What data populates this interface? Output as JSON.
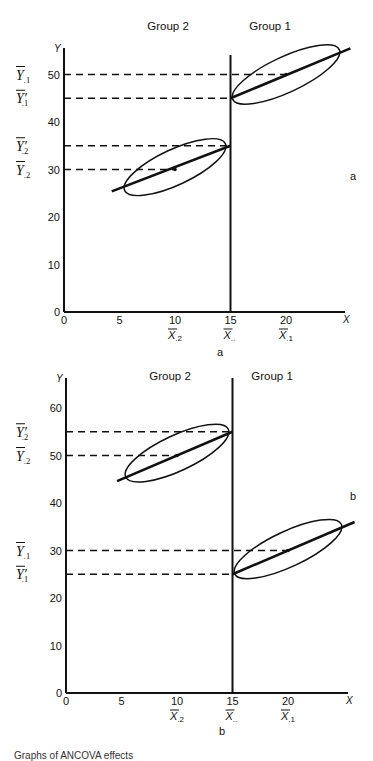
{
  "chart_data": [
    {
      "panel": "a",
      "type": "scatter",
      "title": "",
      "xlabel": "X",
      "ylabel": "Y",
      "xlim": [
        0,
        25
      ],
      "ylim": [
        0,
        55
      ],
      "x_ticks": [
        0,
        5,
        10,
        15,
        20
      ],
      "y_ticks": [
        0,
        10,
        20,
        30,
        40,
        50
      ],
      "x_tick_labels": [
        "0",
        "5",
        "10",
        "15",
        "20"
      ],
      "y_tick_labels": [
        "0",
        "10",
        "20",
        "30",
        "40",
        "50"
      ],
      "x_mean_labels": [
        {
          "x": 10,
          "symbol": "X",
          "subscript": ".2"
        },
        {
          "x": 15,
          "symbol": "X",
          "subscript": ".."
        },
        {
          "x": 20,
          "symbol": "X",
          "subscript": ".1"
        }
      ],
      "grand_mean_x": 15,
      "groups": [
        {
          "name": "Group 2",
          "mean_x": 10,
          "mean_y": 30,
          "adjusted_mean_y": 35,
          "line_from": [
            4.3,
            25.4
          ],
          "line_to": [
            15,
            35
          ],
          "ellipse_center": [
            10,
            30.5
          ],
          "ellipse_rx": 5.0,
          "ellipse_ry": 1.6,
          "ellipse_angle_deg": -25
        },
        {
          "name": "Group 1",
          "mean_x": 20,
          "mean_y": 50,
          "adjusted_mean_y": 45,
          "line_from": [
            15,
            45
          ],
          "line_to": [
            25.8,
            55.5
          ],
          "ellipse_center": [
            20,
            50
          ],
          "ellipse_rx": 5.3,
          "ellipse_ry": 1.6,
          "ellipse_angle_deg": -25
        }
      ],
      "y_mean_labels": [
        {
          "y": 50,
          "symbol": "Y",
          "prime": false,
          "subscript": ".1"
        },
        {
          "y": 45,
          "symbol": "Y",
          "prime": true,
          "subscript": ".1"
        },
        {
          "y": 35,
          "symbol": "Y",
          "prime": true,
          "subscript": ".2"
        },
        {
          "y": 30,
          "symbol": "Y",
          "prime": false,
          "subscript": ".2"
        }
      ],
      "annotation": "a",
      "panel_label": "a",
      "grid": false,
      "legend": "none"
    },
    {
      "panel": "b",
      "type": "scatter",
      "title": "",
      "xlabel": "X",
      "ylabel": "Y",
      "xlim": [
        0,
        25
      ],
      "ylim": [
        0,
        65
      ],
      "x_ticks": [
        0,
        5,
        10,
        15,
        20
      ],
      "y_ticks": [
        0,
        10,
        20,
        30,
        40,
        50,
        60
      ],
      "x_tick_labels": [
        "0",
        "5",
        "10",
        "15",
        "20"
      ],
      "y_tick_labels": [
        "0",
        "10",
        "20",
        "30",
        "40",
        "50",
        "60"
      ],
      "x_mean_labels": [
        {
          "x": 10,
          "symbol": "X",
          "subscript": ".2"
        },
        {
          "x": 15,
          "symbol": "X",
          "subscript": ".."
        },
        {
          "x": 20,
          "symbol": "X",
          "subscript": ".1"
        }
      ],
      "grand_mean_x": 15,
      "groups": [
        {
          "name": "Group 2",
          "mean_x": 10,
          "mean_y": 50,
          "adjusted_mean_y": 55,
          "line_from": [
            4.6,
            44.6
          ],
          "line_to": [
            15,
            55
          ],
          "ellipse_center": [
            10,
            50.5
          ],
          "ellipse_rx": 5.1,
          "ellipse_ry": 1.6,
          "ellipse_angle_deg": -25
        },
        {
          "name": "Group 1",
          "mean_x": 20,
          "mean_y": 30,
          "adjusted_mean_y": 25,
          "line_from": [
            15,
            25
          ],
          "line_to": [
            26,
            36
          ],
          "ellipse_center": [
            20,
            30.3
          ],
          "ellipse_rx": 5.3,
          "ellipse_ry": 1.6,
          "ellipse_angle_deg": -25
        }
      ],
      "y_mean_labels": [
        {
          "y": 55,
          "symbol": "Y",
          "prime": true,
          "subscript": ".2"
        },
        {
          "y": 50,
          "symbol": "Y",
          "prime": false,
          "subscript": ".2"
        },
        {
          "y": 30,
          "symbol": "Y",
          "prime": false,
          "subscript": ".1"
        },
        {
          "y": 25,
          "symbol": "Y",
          "prime": true,
          "subscript": ".1"
        }
      ],
      "annotation": "b",
      "panel_label": "b",
      "grid": false,
      "legend": "none"
    }
  ],
  "layout": {
    "panels": [
      {
        "x0": 64,
        "y0": 312,
        "px_per_x": 11.1,
        "px_per_y": 4.75,
        "x_axis_end": 345,
        "y_axis_top": 48,
        "vline_top": 55,
        "group2_label_pos": [
          168,
          30
        ],
        "group1_label_pos": [
          270,
          30
        ],
        "annotation_pos": [
          350,
          180
        ],
        "panel_label_pos": [
          220,
          356
        ]
      },
      {
        "x0": 66,
        "y0": 693,
        "px_per_x": 11.1,
        "px_per_y": 4.75,
        "x_axis_end": 348,
        "y_axis_top": 378,
        "vline_top": 378,
        "group2_label_pos": [
          170,
          380
        ],
        "group1_label_pos": [
          272,
          380
        ],
        "annotation_pos": [
          350,
          500
        ],
        "panel_label_pos": [
          222,
          735
        ]
      }
    ]
  },
  "caption": "Graphs of ANCOVA effects"
}
